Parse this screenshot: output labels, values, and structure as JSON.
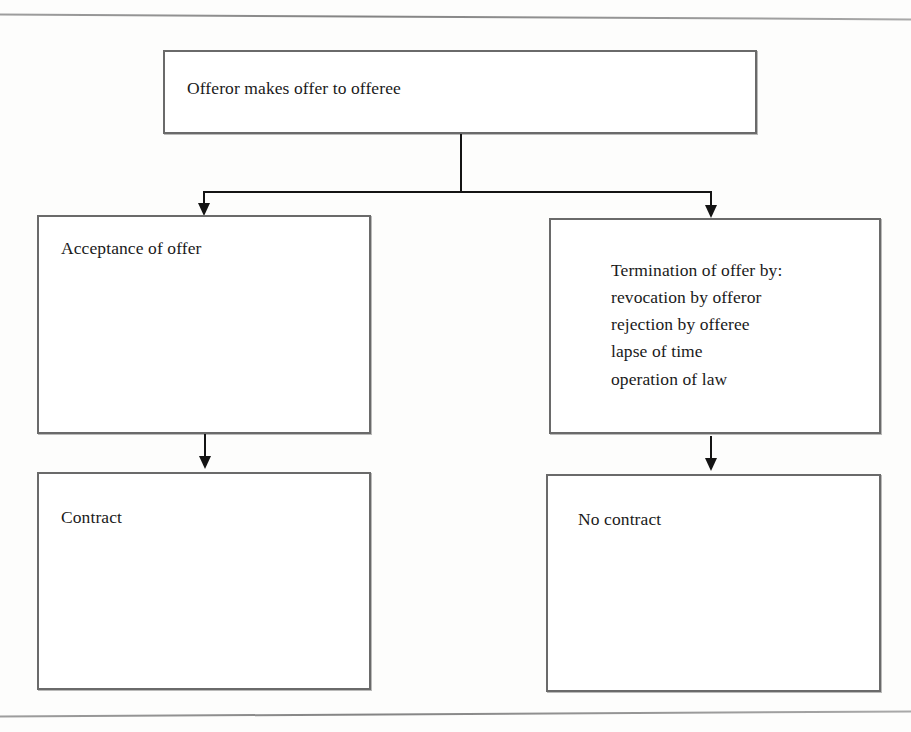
{
  "diagram": {
    "nodes": [
      {
        "id": "offer",
        "label": "Offeror makes offer to offeree",
        "text": "Offeror makes offer to offeree"
      },
      {
        "id": "acceptance",
        "label": "Acceptance of offer",
        "text": "Acceptance of offer"
      },
      {
        "id": "termination",
        "label": "Termination of offer",
        "text": "Termination of offer by:\nrevocation by offeror\nrejection by offeree\nlapse of time\noperation of law"
      },
      {
        "id": "contract",
        "label": "Contract",
        "text": "Contract"
      },
      {
        "id": "no-contract",
        "label": "No contract",
        "text": "No contract"
      }
    ],
    "edges": [
      {
        "id": "offer-to-acceptance",
        "from": "offer",
        "to": "acceptance",
        "style": "elbow-arrow"
      },
      {
        "id": "offer-to-termination",
        "from": "offer",
        "to": "termination",
        "style": "elbow-arrow"
      },
      {
        "id": "acceptance-to-contract",
        "from": "acceptance",
        "to": "contract",
        "style": "straight-arrow"
      },
      {
        "id": "termination-to-no-contract",
        "from": "termination",
        "to": "no-contract",
        "style": "straight-arrow"
      }
    ],
    "colors": {
      "box_border": "#6a6a6a",
      "connector": "#141414",
      "text": "#1a1a1a",
      "background": "#fdfdfc",
      "rule": "#7c7c7c"
    }
  }
}
